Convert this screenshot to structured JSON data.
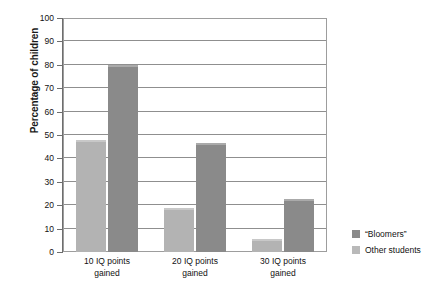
{
  "chart_data": {
    "type": "bar",
    "title": "",
    "subtitle": "",
    "xlabel": "",
    "ylabel": "Percentage of children",
    "ylim": [
      0,
      100
    ],
    "ytick_step": 10,
    "yticks": [
      0,
      10,
      20,
      30,
      40,
      50,
      60,
      70,
      80,
      90,
      100
    ],
    "ytick_labels": [
      "0",
      "10",
      "20",
      "30",
      "40",
      "50",
      "60",
      "70",
      "80",
      "90",
      "100"
    ],
    "grid": true,
    "grid_axis": "y",
    "legend_position": "right",
    "categories": [
      "10 IQ points gained",
      "20 IQ points gained",
      "30 IQ points gained"
    ],
    "category_lines": [
      [
        "10 IQ points",
        "gained"
      ],
      [
        "20 IQ points",
        "gained"
      ],
      [
        "30 IQ points",
        "gained"
      ]
    ],
    "series": [
      {
        "name": "Other students",
        "color": "#b3b3b3",
        "values": [
          48,
          19,
          5.5
        ],
        "draw_order": 0
      },
      {
        "name": "“Bloomers”",
        "color": "#8a8a8a",
        "values": [
          80,
          46.5,
          22.5
        ],
        "draw_order": 1
      }
    ]
  },
  "legend": {
    "entries": [
      {
        "label": "“Bloomers”",
        "color": "#8a8a8a",
        "swatch": "dark"
      },
      {
        "label": "Other students",
        "color": "#b9b9b9",
        "swatch": "light"
      }
    ]
  },
  "axes": {
    "y_title": "Percentage of children",
    "y_tick_labels": [
      "100",
      "90",
      "80",
      "70",
      "60",
      "50",
      "40",
      "30",
      "20",
      "10",
      "0"
    ]
  },
  "colors": {
    "bar_light": "#b3b3b3",
    "bar_dark": "#8a8a8a",
    "gridline": "#8f8f8f",
    "frame": "#9d9d9d",
    "text": "#111111",
    "background": "#ffffff"
  }
}
